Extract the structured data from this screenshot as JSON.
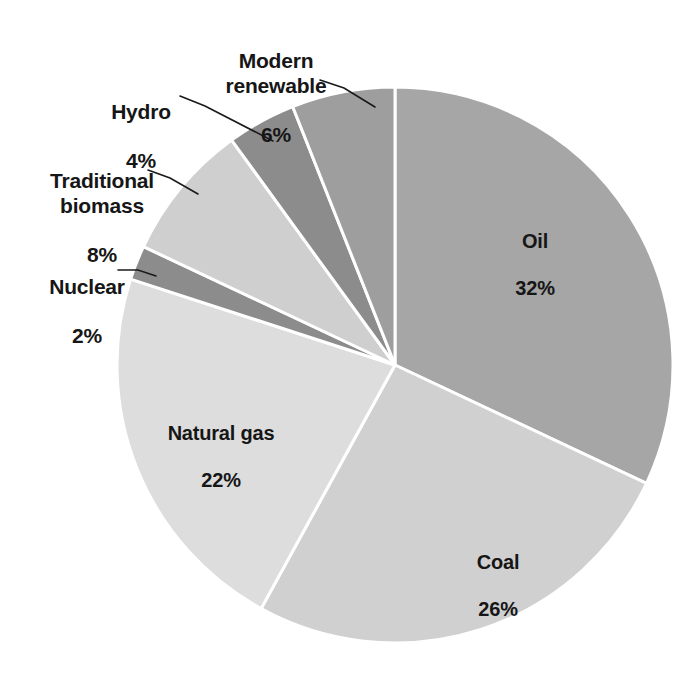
{
  "chart_data": {
    "type": "pie",
    "title": "",
    "subtitle": "",
    "xlabel": "",
    "ylabel": "",
    "legend_position": "none",
    "grid": false,
    "units": "%",
    "start_angle_deg": 0,
    "direction": "clockwise",
    "categories": [
      "Oil",
      "Coal",
      "Natural gas",
      "Nuclear",
      "Traditional biomass",
      "Hydro",
      "Modern renewable"
    ],
    "values": [
      32,
      26,
      22,
      2,
      8,
      4,
      6
    ],
    "slices": [
      {
        "id": "oil",
        "label": "Oil",
        "value": 32,
        "value_text": "32%",
        "color": "#a6a6a6",
        "label_placement": "inside",
        "start_deg": 0,
        "end_deg": 115.2
      },
      {
        "id": "coal",
        "label": "Coal",
        "value": 26,
        "value_text": "26%",
        "color": "#d0d0d0",
        "label_placement": "inside",
        "start_deg": 115.2,
        "end_deg": 208.8
      },
      {
        "id": "natural-gas",
        "label": "Natural gas",
        "value": 22,
        "value_text": "22%",
        "color": "#dddddd",
        "label_placement": "inside",
        "start_deg": 208.8,
        "end_deg": 288.0
      },
      {
        "id": "nuclear",
        "label": "Nuclear",
        "value": 2,
        "value_text": "2%",
        "color": "#8c8c8c",
        "label_placement": "outside",
        "start_deg": 288.0,
        "end_deg": 295.2
      },
      {
        "id": "traditional-biomass",
        "label": "Traditional\nbiomass",
        "value": 8,
        "value_text": "8%",
        "color": "#cfcfcf",
        "label_placement": "outside",
        "start_deg": 295.2,
        "end_deg": 324.0
      },
      {
        "id": "hydro",
        "label": "Hydro",
        "value": 4,
        "value_text": "4%",
        "color": "#8c8c8c",
        "label_placement": "outside",
        "start_deg": 324.0,
        "end_deg": 338.4
      },
      {
        "id": "modern-renewable",
        "label": "Modern\nrenewable",
        "value": 6,
        "value_text": "6%",
        "color": "#9e9e9e",
        "label_placement": "outside",
        "start_deg": 338.4,
        "end_deg": 360.0
      }
    ],
    "geometry": {
      "center_x": 395,
      "center_y": 365,
      "radius": 278,
      "slice_border_color": "#ffffff",
      "background": "#ffffff",
      "text_color": "#161616"
    }
  }
}
